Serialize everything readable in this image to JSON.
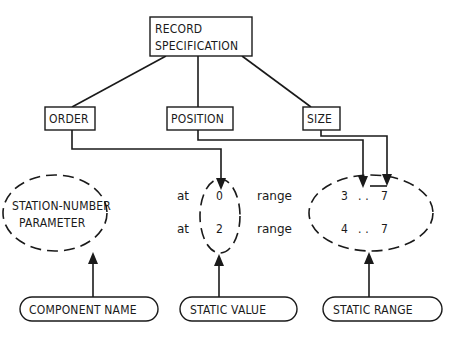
{
  "diagram": {
    "root": {
      "line1": "RECORD",
      "line2": "SPECIFICATION"
    },
    "attributes": [
      {
        "label": "ORDER"
      },
      {
        "label": "POSITION"
      },
      {
        "label": "SIZE"
      }
    ],
    "component": {
      "line1": "STATION-NUMBER",
      "line2": "PARAMETER"
    },
    "positions": [
      {
        "keyword": "at",
        "value": "0"
      },
      {
        "keyword": "at",
        "value": "2"
      }
    ],
    "ranges": [
      {
        "keyword": "range",
        "low": "3",
        "dots": ". .",
        "high": "7"
      },
      {
        "keyword": "range",
        "low": "4",
        "dots": ". .",
        "high": "7"
      }
    ],
    "legend": [
      {
        "label": "COMPONENT NAME"
      },
      {
        "label": "STATIC VALUE"
      },
      {
        "label": "STATIC RANGE"
      }
    ]
  }
}
